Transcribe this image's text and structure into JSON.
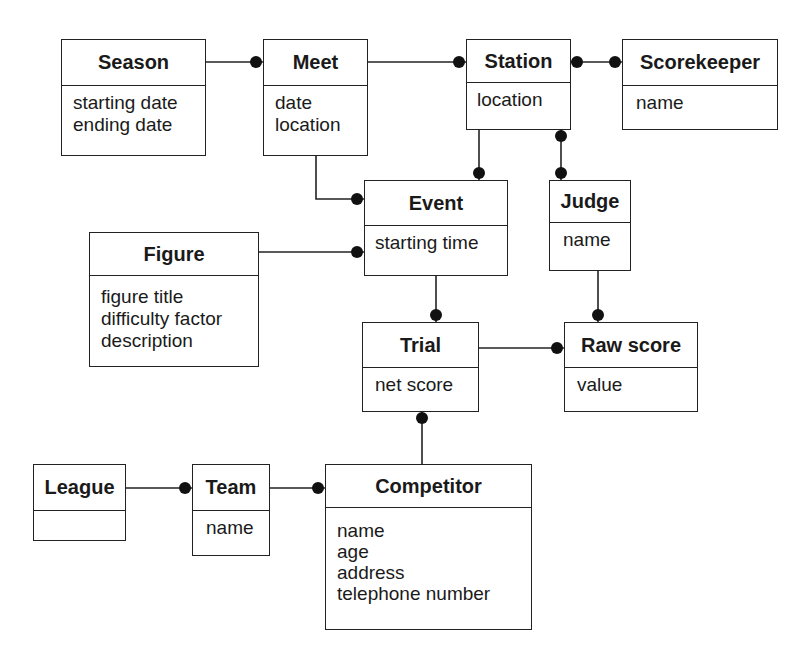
{
  "diagram": {
    "type": "object model (OMT class diagram)",
    "entities": [
      {
        "id": "season",
        "name": "Season",
        "attributes": [
          "starting date",
          "ending date"
        ]
      },
      {
        "id": "meet",
        "name": "Meet",
        "attributes": [
          "date",
          "location"
        ]
      },
      {
        "id": "station",
        "name": "Station",
        "attributes": [
          "location"
        ]
      },
      {
        "id": "scorekeeper",
        "name": "Scorekeeper",
        "attributes": [
          "name"
        ]
      },
      {
        "id": "event",
        "name": "Event",
        "attributes": [
          "starting time"
        ]
      },
      {
        "id": "judge",
        "name": "Judge",
        "attributes": [
          "name"
        ]
      },
      {
        "id": "figure",
        "name": "Figure",
        "attributes": [
          "figure title",
          "difficulty factor",
          "description"
        ]
      },
      {
        "id": "trial",
        "name": "Trial",
        "attributes": [
          "net score"
        ]
      },
      {
        "id": "rawscore",
        "name": "Raw score",
        "attributes": [
          "value"
        ]
      },
      {
        "id": "league",
        "name": "League",
        "attributes": []
      },
      {
        "id": "team",
        "name": "Team",
        "attributes": [
          "name"
        ]
      },
      {
        "id": "competitor",
        "name": "Competitor",
        "attributes": [
          "name",
          "age",
          "address",
          "telephone number"
        ]
      }
    ],
    "associations": [
      {
        "from": "Season",
        "to": "Meet",
        "multiplicity_at_to": "many"
      },
      {
        "from": "Meet",
        "to": "Station",
        "multiplicity_at_to": "many"
      },
      {
        "from": "Station",
        "to": "Scorekeeper",
        "multiplicity_at_from": "many",
        "multiplicity_at_to": "many"
      },
      {
        "from": "Meet",
        "to": "Event",
        "multiplicity_at_to": "many"
      },
      {
        "from": "Station",
        "to": "Event",
        "multiplicity_at_to": "many"
      },
      {
        "from": "Station",
        "to": "Judge",
        "multiplicity_at_from": "many",
        "multiplicity_at_to": "many"
      },
      {
        "from": "Figure",
        "to": "Event",
        "multiplicity_at_to": "many"
      },
      {
        "from": "Event",
        "to": "Trial",
        "multiplicity_at_to": "many"
      },
      {
        "from": "Judge",
        "to": "Raw score",
        "multiplicity_at_to": "many"
      },
      {
        "from": "Trial",
        "to": "Raw score",
        "multiplicity_at_to": "many"
      },
      {
        "from": "Competitor",
        "to": "Trial",
        "multiplicity_at_to": "many"
      },
      {
        "from": "League",
        "to": "Team",
        "multiplicity_at_to": "many"
      },
      {
        "from": "Team",
        "to": "Competitor",
        "multiplicity_at_to": "many"
      }
    ]
  }
}
